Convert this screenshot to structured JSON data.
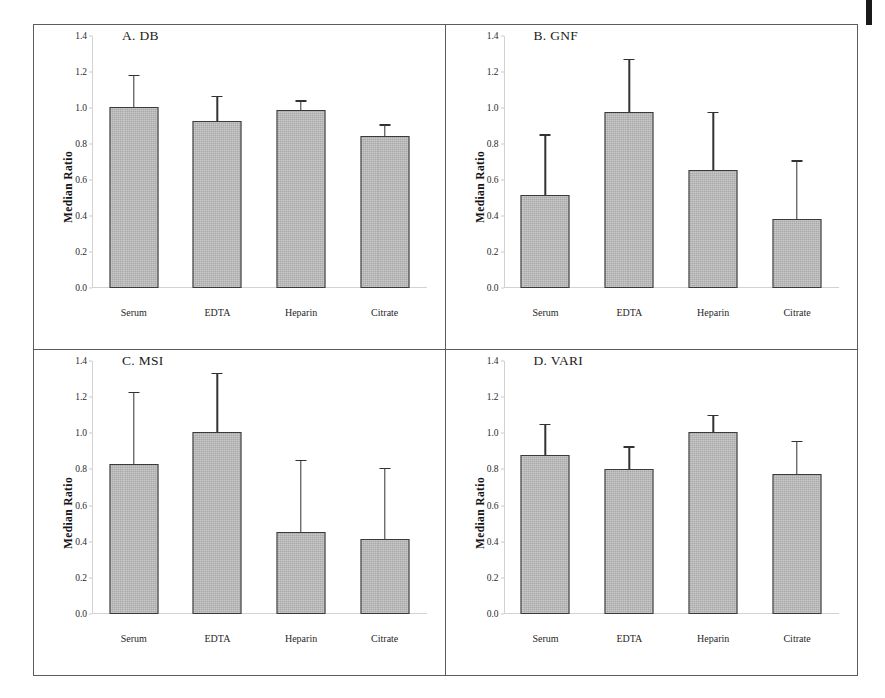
{
  "figure": {
    "background_color": "#ffffff",
    "frame_color": "#5c5c5c",
    "bar_fill_color": "#a9a9a9",
    "bar_border_color": "#3a3a3a",
    "error_bar_color": "#323232",
    "axis_line_color": "#d2d2d2"
  },
  "chart_data": [
    {
      "type": "bar",
      "panel": "A",
      "title": "A.  DB",
      "xlabel": "",
      "ylabel": "Median Ratio",
      "ylim": [
        0.0,
        1.4
      ],
      "yticks": [
        "0.0",
        "0.2",
        "0.4",
        "0.6",
        "0.8",
        "1.0",
        "1.2",
        "1.4"
      ],
      "ytick_values": [
        0.0,
        0.2,
        0.4,
        0.6,
        0.8,
        1.0,
        1.2,
        1.4
      ],
      "grid": false,
      "legend": "none",
      "categories": [
        "Serum",
        "EDTA",
        "Heparin",
        "Citrate"
      ],
      "values": [
        1.005,
        0.93,
        0.99,
        0.845
      ],
      "error_upper": [
        1.18,
        1.065,
        1.04,
        0.905
      ]
    },
    {
      "type": "bar",
      "panel": "B",
      "title": "B.  GNF",
      "xlabel": "",
      "ylabel": "Median Ratio",
      "ylim": [
        0.0,
        1.4
      ],
      "yticks": [
        "0.0",
        "0.2",
        "0.4",
        "0.6",
        "0.8",
        "1.0",
        "1.2",
        "1.4"
      ],
      "ytick_values": [
        0.0,
        0.2,
        0.4,
        0.6,
        0.8,
        1.0,
        1.2,
        1.4
      ],
      "grid": false,
      "legend": "none",
      "categories": [
        "Serum",
        "EDTA",
        "Heparin",
        "Citrate"
      ],
      "values": [
        0.515,
        0.98,
        0.655,
        0.385
      ],
      "error_upper": [
        0.85,
        1.27,
        0.975,
        0.705
      ]
    },
    {
      "type": "bar",
      "panel": "C",
      "title": "C.  MSI",
      "xlabel": "",
      "ylabel": "Median Ratio",
      "ylim": [
        0.0,
        1.4
      ],
      "yticks": [
        "0.0",
        "0.2",
        "0.4",
        "0.6",
        "0.8",
        "1.0",
        "1.2",
        "1.4"
      ],
      "ytick_values": [
        0.0,
        0.2,
        0.4,
        0.6,
        0.8,
        1.0,
        1.2,
        1.4
      ],
      "grid": false,
      "legend": "none",
      "categories": [
        "Serum",
        "EDTA",
        "Heparin",
        "Citrate"
      ],
      "values": [
        0.83,
        1.005,
        0.455,
        0.415
      ],
      "error_upper": [
        1.225,
        1.33,
        0.85,
        0.805
      ]
    },
    {
      "type": "bar",
      "panel": "D",
      "title": "D.  VARI",
      "xlabel": "",
      "ylabel": "Median Ratio",
      "ylim": [
        0.0,
        1.4
      ],
      "yticks": [
        "0.0",
        "0.2",
        "0.4",
        "0.6",
        "0.8",
        "1.0",
        "1.2",
        "1.4"
      ],
      "ytick_values": [
        0.0,
        0.2,
        0.4,
        0.6,
        0.8,
        1.0,
        1.2,
        1.4
      ],
      "grid": false,
      "legend": "none",
      "categories": [
        "Serum",
        "EDTA",
        "Heparin",
        "Citrate"
      ],
      "values": [
        0.88,
        0.8,
        1.005,
        0.775
      ],
      "error_upper": [
        1.05,
        0.925,
        1.1,
        0.955
      ]
    }
  ]
}
